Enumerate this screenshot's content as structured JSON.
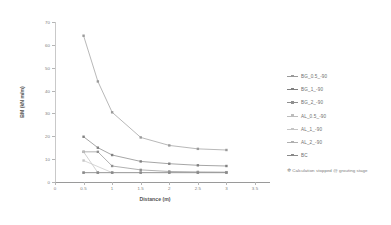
{
  "chart_data": {
    "type": "line",
    "title": "",
    "xlabel": "Distance (m)",
    "ylabel": "BM (kN m/m)",
    "xlim": [
      0,
      3.5
    ],
    "ylim": [
      0,
      70
    ],
    "xticks": [
      "0",
      "0.5",
      "1",
      "1.5",
      "2",
      "2.5",
      "3",
      "3.5"
    ],
    "xtick_values": [
      0,
      0.5,
      1,
      1.5,
      2,
      2.5,
      3,
      3.5
    ],
    "yticks": [
      "0",
      "10",
      "20",
      "30",
      "40",
      "50",
      "60",
      "70"
    ],
    "ytick_values": [
      0,
      10,
      20,
      30,
      40,
      50,
      60,
      70
    ],
    "grid": false,
    "legend_position": "right",
    "x": [
      0.5,
      0.75,
      1,
      1.5,
      2,
      2.5,
      3
    ],
    "series": [
      {
        "name": "BG_0.5_-90",
        "color": "#9a9a9a",
        "marker": "square",
        "x": [
          0.5,
          0.75,
          1,
          1.5,
          2,
          2.5,
          3
        ],
        "values": [
          64,
          44,
          30.5,
          19.5,
          16,
          14.5,
          14
        ]
      },
      {
        "name": "BG_1_-90",
        "color": "#808080",
        "marker": "square",
        "x": [
          0.5,
          0.75,
          1,
          1.5,
          2,
          2.5,
          3
        ],
        "values": [
          19.8,
          15,
          11.8,
          9,
          8,
          7.3,
          7
        ]
      },
      {
        "name": "BG_2_-90",
        "color": "#8f8f8f",
        "marker": "square",
        "x": [
          0.5,
          0.75,
          1,
          1.5,
          2,
          2.5,
          3
        ],
        "values": [
          13.2,
          13.2,
          7,
          5.3,
          4.6,
          4.4,
          4.3
        ],
        "note": "Calculation stopped @ grouting stage"
      },
      {
        "name": "AL_0.5_-90",
        "color": "#bdbdbd",
        "marker": "square",
        "x": [
          0.5,
          0.75
        ],
        "values": [
          13.2,
          4.1
        ],
        "note": "Calculation stopped @ grouting stage"
      },
      {
        "name": "AL_1_-90",
        "color": "#c6c6c6",
        "marker": "square",
        "x": [
          0.5,
          1
        ],
        "values": [
          9.4,
          4.1
        ],
        "note": "Calculation stopped @ grouting stage"
      },
      {
        "name": "AL_2_-90",
        "color": "#b0b0b0",
        "marker": "square",
        "x": [
          0.5,
          0.75,
          1,
          1.5,
          2,
          2.5,
          3
        ],
        "values": [
          4.1,
          4.1,
          4.1,
          4.1,
          4.1,
          4.1,
          4.1
        ]
      },
      {
        "name": "BC",
        "color": "#8a8a8a",
        "marker": "square",
        "x": [
          0.5,
          0.75,
          1,
          1.5,
          2,
          2.5,
          3
        ],
        "values": [
          4.1,
          4.1,
          4.1,
          4.1,
          4.1,
          4.1,
          4.1
        ]
      }
    ],
    "annotations": [
      {
        "text": "Calculation stopped @ grouting stage",
        "marker": "✲"
      }
    ]
  },
  "legend": {
    "note_marker": "✲",
    "note_text": "Calculation stopped @ grouting stage"
  }
}
